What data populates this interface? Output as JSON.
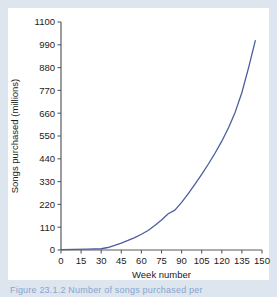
{
  "figure": {
    "background_color": "#dde5ee",
    "plot_background_color": "#ffffff",
    "caption_text": "Figure 23.1.2  Number of songs purchased per"
  },
  "chart_data": {
    "type": "line",
    "title": "",
    "xlabel": "Week number",
    "ylabel": "Songs purchased (millions)",
    "xlim": [
      0,
      150
    ],
    "ylim": [
      0,
      1100
    ],
    "grid": false,
    "legend": "none",
    "line_color": "#4a5e9e",
    "xticks": [
      0,
      15,
      30,
      45,
      60,
      75,
      90,
      105,
      120,
      135,
      150
    ],
    "yticks": [
      0,
      110,
      220,
      330,
      440,
      550,
      660,
      770,
      880,
      990,
      1100
    ],
    "series": [
      {
        "name": "Songs purchased",
        "x": [
          0,
          10,
          20,
          30,
          35,
          40,
          45,
          50,
          55,
          60,
          65,
          70,
          75,
          80,
          85,
          90,
          95,
          100,
          105,
          110,
          115,
          120,
          125,
          130,
          135,
          140,
          145
        ],
        "y": [
          2,
          3,
          4,
          6,
          12,
          22,
          33,
          46,
          60,
          76,
          94,
          118,
          145,
          175,
          192,
          230,
          272,
          318,
          365,
          415,
          468,
          525,
          590,
          665,
          760,
          880,
          1010
        ]
      }
    ]
  }
}
